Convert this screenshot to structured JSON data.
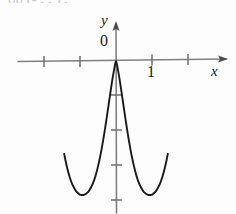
{
  "figure": {
    "background_color": "#fdfdfd",
    "axis_color": "#808080",
    "curve_color": "#1a1a1a",
    "text_color": "#1a1a1a",
    "cropped_header_text": "00 (- , , ) ,"
  },
  "labels": {
    "y_axis": "y",
    "x_axis": "x",
    "origin": "0",
    "x_tick_one": "1"
  },
  "chart_data": {
    "type": "line",
    "title": "",
    "subtitle": "",
    "xlabel": "x",
    "ylabel": "y",
    "grid": false,
    "legend": null,
    "annotations": [
      {
        "text": "0",
        "x": 0,
        "y": 0,
        "role": "origin-label"
      },
      {
        "text": "1",
        "x": 1,
        "y": 0,
        "role": "x-tick-label"
      }
    ],
    "xlim": [
      -2.0,
      3.1
    ],
    "ylim": [
      -4.0,
      0.35
    ],
    "x_ticks": [
      -2,
      -1,
      1,
      2
    ],
    "x_tick_labels": [
      "",
      "",
      "1",
      ""
    ],
    "y_ticks": [
      -1,
      -2,
      -3,
      -4
    ],
    "y_tick_labels": [
      "",
      "",
      "",
      ""
    ],
    "axis_arrows": {
      "x": "right",
      "y": "up"
    },
    "series": [
      {
        "name": "curve",
        "description": "W-shaped quartic with local maximum at the origin and two symmetric minima",
        "x": [
          -1.44,
          -1.4,
          -1.35,
          -1.3,
          -1.25,
          -1.2,
          -1.15,
          -1.1,
          -1.05,
          -1.0,
          -0.95,
          -0.9,
          -0.85,
          -0.8,
          -0.75,
          -0.7,
          -0.65,
          -0.6,
          -0.55,
          -0.5,
          -0.45,
          -0.4,
          -0.35,
          -0.3,
          -0.25,
          -0.2,
          -0.15,
          -0.1,
          -0.05,
          0.0,
          0.05,
          0.1,
          0.15,
          0.2,
          0.25,
          0.3,
          0.35,
          0.4,
          0.45,
          0.5,
          0.55,
          0.6,
          0.65,
          0.7,
          0.75,
          0.8,
          0.85,
          0.9,
          0.95,
          1.0,
          1.05,
          1.1,
          1.15,
          1.2,
          1.25,
          1.3,
          1.35,
          1.4,
          1.44
        ],
        "y": [
          -2.73,
          -2.94,
          -3.17,
          -3.37,
          -3.53,
          -3.66,
          -3.76,
          -3.84,
          -3.89,
          -3.93,
          -3.94,
          -3.94,
          -3.92,
          -3.88,
          -3.82,
          -3.73,
          -3.62,
          -3.48,
          -3.31,
          -3.1,
          -2.86,
          -2.59,
          -2.29,
          -1.96,
          -1.61,
          -1.25,
          -0.89,
          -0.54,
          -0.24,
          0.0,
          -0.24,
          -0.54,
          -0.89,
          -1.25,
          -1.61,
          -1.96,
          -2.29,
          -2.59,
          -2.86,
          -3.1,
          -3.31,
          -3.48,
          -3.62,
          -3.73,
          -3.82,
          -3.88,
          -3.92,
          -3.94,
          -3.94,
          -3.93,
          -3.89,
          -3.84,
          -3.76,
          -3.66,
          -3.53,
          -3.37,
          -3.17,
          -2.94,
          -2.73
        ]
      }
    ],
    "features": {
      "local_maximum": {
        "x": 0,
        "y": 0
      },
      "local_minima": [
        {
          "x": -0.92,
          "y": -3.94
        },
        {
          "x": 0.92,
          "y": -3.94
        }
      ],
      "symmetry": "even (symmetric about the y-axis)"
    }
  }
}
